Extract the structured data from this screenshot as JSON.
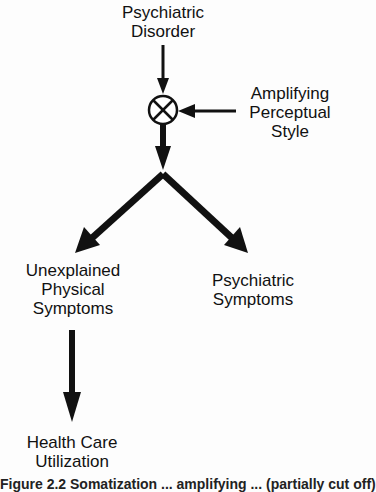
{
  "nodes": {
    "disorder": {
      "line1": "Psychiatric",
      "line2": "Disorder"
    },
    "amplifying": {
      "line1": "Amplifying",
      "line2": "Perceptual",
      "line3": "Style"
    },
    "unexplained": {
      "line1": "Unexplained",
      "line2": "Physical",
      "line3": "Symptoms"
    },
    "psych_symptoms": {
      "line1": "Psychiatric",
      "line2": "Symptoms"
    },
    "utilization": {
      "line1": "Health Care",
      "line2": "Utilization"
    }
  },
  "multiplier_symbol": "circled-times",
  "caption": "Figure 2.2   Somatization ... amplifying ... (partially cut off)"
}
